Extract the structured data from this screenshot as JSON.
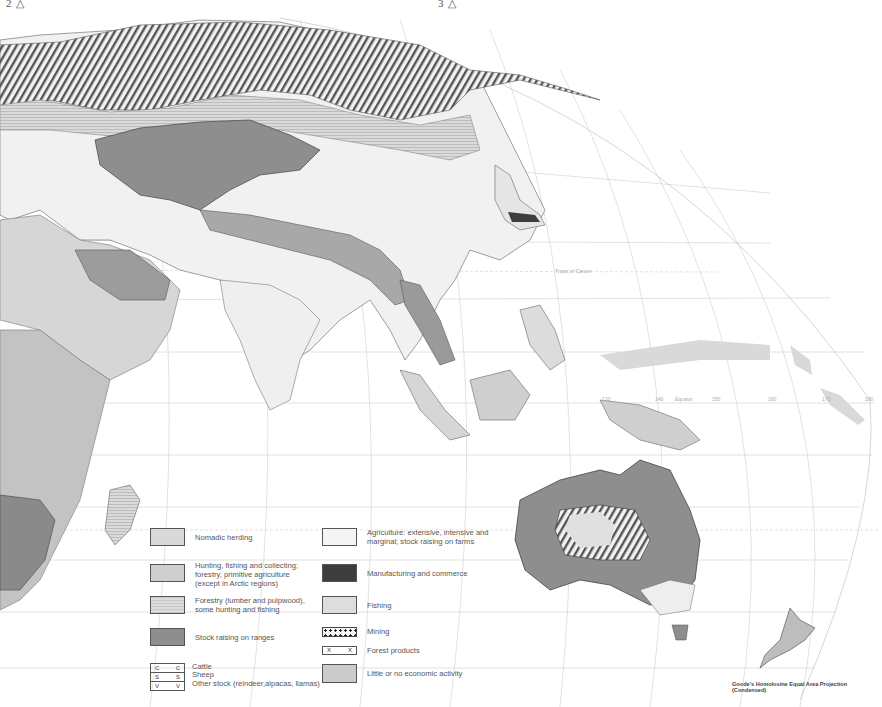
{
  "page_markers": {
    "left": "2 △",
    "right": "3 △"
  },
  "map": {
    "subject": "World economic activity — Eastern Hemisphere (Europe, Asia, Africa, Australia, Oceania)",
    "projection": "Goode's Homolosine Equal Area Projection (Condensed)",
    "grid_labels": {
      "equator": "Equator",
      "tropic_north": "Tropic of Cancer",
      "tropic_south": "Tropic of Capricorn",
      "longitudes": [
        "120",
        "140",
        "150",
        "160",
        "170",
        "180"
      ],
      "latitudes": [
        "40",
        "30",
        "20",
        "10",
        "10",
        "20",
        "30",
        "40"
      ]
    },
    "map_symbols": {
      "cattle": "C",
      "sheep": "S",
      "other_stock": "V",
      "forest_products": "X"
    }
  },
  "legend": {
    "left_column": [
      {
        "key": "nomadic",
        "label": "Nomadic herding"
      },
      {
        "key": "hunting",
        "label": "Hunting, fishing and collecting; forestry, primitive agriculture (except in Arctic regions)"
      },
      {
        "key": "forestry",
        "label": "Forestry (lumber and pulpwood), some hunting and fishing"
      },
      {
        "key": "stock",
        "label": "Stock raising on ranges"
      }
    ],
    "stock_symbols": [
      {
        "symbol": "C",
        "label": "Cattle"
      },
      {
        "symbol": "S",
        "label": "Sheep"
      },
      {
        "symbol": "V",
        "label": "Other stock (reindeer,alpacas, llamas)"
      }
    ],
    "right_column": [
      {
        "key": "agri",
        "label": "Agriculture: extensive, intensive and marginal; stock raising on farms"
      },
      {
        "key": "manuf",
        "label": "Manufacturing and commerce"
      },
      {
        "key": "fishing",
        "label": "Fishing"
      },
      {
        "key": "mining",
        "label": "Mining"
      },
      {
        "key": "forestprod",
        "label": "Forest products",
        "symbol": "X"
      },
      {
        "key": "little",
        "label": "Little or no economic activity"
      }
    ]
  },
  "colors": {
    "nomadic": "#d9d9d9",
    "hunting": "#cfcfcf",
    "forestry": "#d3d3d3",
    "stock": "#8e8e8e",
    "agri": "#f4f4f4",
    "manuf": "#3d3d3d",
    "fishing": "#dddddd",
    "little": "#cbcbcb",
    "grid": "#c8c8c8"
  }
}
